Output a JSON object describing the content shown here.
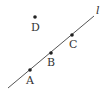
{
  "diagram": {
    "width": 109,
    "height": 95,
    "line": {
      "name": "l",
      "label": "l",
      "x1": 8,
      "y1": 88,
      "x2": 94,
      "y2": 16,
      "label_x": 96,
      "label_y": 14,
      "color": "#555555"
    },
    "points": [
      {
        "name": "A",
        "label": "A",
        "x": 30,
        "y": 70,
        "label_x": 26,
        "label_y": 84,
        "on_line": true
      },
      {
        "name": "B",
        "label": "B",
        "x": 51,
        "y": 53,
        "label_x": 47,
        "label_y": 66,
        "on_line": true
      },
      {
        "name": "C",
        "label": "C",
        "x": 72,
        "y": 35,
        "label_x": 69,
        "label_y": 48,
        "on_line": true
      },
      {
        "name": "D",
        "label": "D",
        "x": 35,
        "y": 17,
        "label_x": 31,
        "label_y": 31,
        "on_line": false
      }
    ],
    "point_color": "#222222"
  }
}
